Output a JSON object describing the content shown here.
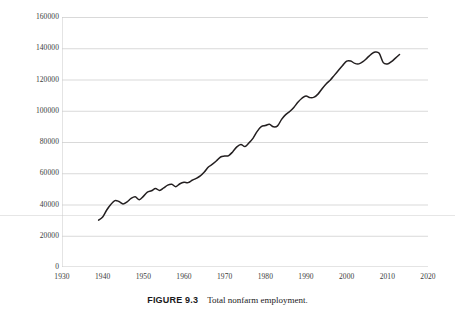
{
  "caption": {
    "label": "FIGURE 9.3",
    "title": "Total nonfarm employment."
  },
  "chart_data": {
    "type": "line",
    "title": "Total nonfarm employment",
    "xlabel": "",
    "ylabel": "",
    "xlim": [
      1930,
      2020
    ],
    "ylim": [
      0,
      160000
    ],
    "grid": "horizontal",
    "legend": "none",
    "line_color": "#231f20",
    "grid_color": "#d9d9d9",
    "axis_color": "#c9c9c9",
    "xticks": [
      1930,
      1940,
      1950,
      1960,
      1970,
      1980,
      1990,
      2000,
      2010,
      2020
    ],
    "yticks": [
      0,
      20000,
      40000,
      60000,
      80000,
      100000,
      120000,
      140000,
      160000
    ],
    "series": [
      {
        "name": "Total nonfarm employment",
        "units": "thousands of persons",
        "x": [
          1939,
          1940,
          1941,
          1942,
          1943,
          1944,
          1945,
          1946,
          1947,
          1948,
          1949,
          1950,
          1951,
          1952,
          1953,
          1954,
          1955,
          1956,
          1957,
          1958,
          1959,
          1960,
          1961,
          1962,
          1963,
          1964,
          1965,
          1966,
          1967,
          1968,
          1969,
          1970,
          1971,
          1972,
          1973,
          1974,
          1975,
          1976,
          1977,
          1978,
          1979,
          1980,
          1981,
          1982,
          1983,
          1984,
          1985,
          1986,
          1987,
          1988,
          1989,
          1990,
          1991,
          1992,
          1993,
          1994,
          1995,
          1996,
          1997,
          1998,
          1999,
          2000,
          2001,
          2002,
          2003,
          2004,
          2005,
          2006,
          2007,
          2008,
          2009,
          2010,
          2011,
          2012,
          2013
        ],
        "values": [
          30000,
          32000,
          36500,
          40000,
          42500,
          41900,
          40400,
          41700,
          43900,
          44900,
          43100,
          45200,
          47900,
          48800,
          50200,
          49000,
          50600,
          52400,
          52900,
          51400,
          53300,
          54200,
          54000,
          55500,
          56700,
          58300,
          60800,
          64000,
          65800,
          68000,
          70400,
          71000,
          71300,
          73800,
          76900,
          78400,
          77100,
          79500,
          82500,
          86800,
          89800,
          90500,
          91300,
          89700,
          90300,
          94500,
          97500,
          99500,
          102100,
          105400,
          108000,
          109500,
          108400,
          108700,
          110800,
          114300,
          117300,
          119700,
          122800,
          125900,
          129000,
          131800,
          131800,
          130300,
          130000,
          131400,
          133700,
          136100,
          137600,
          136800,
          130800,
          129900,
          131400,
          133700,
          136000
        ]
      }
    ]
  }
}
